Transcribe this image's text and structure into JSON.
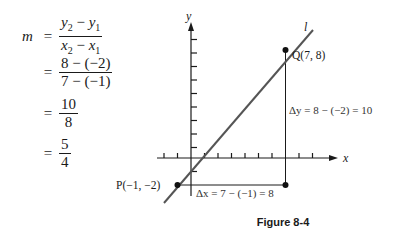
{
  "equation": {
    "lhs": "m",
    "steps": [
      {
        "eq": "=",
        "num_parts": [
          "y",
          "2",
          " − ",
          "y",
          "1"
        ],
        "den_parts": [
          "x",
          "2",
          " − ",
          "x",
          "1"
        ]
      },
      {
        "eq": "=",
        "num": "8 − (−2)",
        "den": "7 − (−1)"
      },
      {
        "eq": "=",
        "num": "10",
        "den": "8"
      },
      {
        "eq": "=",
        "num": "5",
        "den": "4"
      }
    ]
  },
  "diagram": {
    "x_axis_label": "x",
    "y_axis_label": "y",
    "line_label": "l",
    "point_p": {
      "label": "P(−1, −2)",
      "x": -1,
      "y": -2
    },
    "point_q": {
      "label": "Q(7, 8)",
      "x": 7,
      "y": 8
    },
    "delta_y_label": "Δy = 8 − (−2) = 10",
    "delta_x_label": "Δx = 7 − (−1) = 8",
    "line_color": "#555555",
    "axis_color": "#1a1a1a"
  },
  "caption": "Figure 8-4"
}
